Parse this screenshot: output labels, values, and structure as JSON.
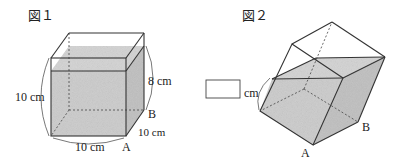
{
  "figure1": {
    "title": "図１",
    "height_label": "10 cm",
    "width_label": "10 cm",
    "depth_label": "10 cm",
    "water_label": "8 cm",
    "point_a": "A",
    "point_b": "B"
  },
  "figure2": {
    "title": "図２",
    "answer_box_value": "",
    "unit_label": "cm",
    "point_a": "A",
    "point_b": "B"
  },
  "colors": {
    "water_fill": "#c9c9c9",
    "line": "#333333"
  }
}
